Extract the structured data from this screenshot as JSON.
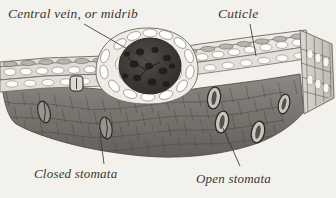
{
  "figure": {
    "kind": "botanical-cross-section-engraving",
    "background_color": "#f3f1ec",
    "ink_color": "#3b3732"
  },
  "labels": {
    "central_vein": "Central vein, or midrib",
    "cuticle": "Cuticle",
    "closed_stomata": "Closed stomata",
    "open_stomata": "Open stomata"
  },
  "structures": {
    "vein_bundle": "central-vein-bundle",
    "upper_epidermis": "upper-epidermis-cell-row",
    "lower_epidermis": "lower-epidermis-cell-row",
    "mesophyll": "mesophyll-cobblestone-tissue",
    "cut_face": "right-cut-face"
  },
  "colors": {
    "mesophyll_dark": "#6f6b66",
    "mesophyll_mid": "#8a8681",
    "epidermis_pale": "#e8e5df",
    "vein_core": "#3a3733",
    "outline": "#55514c"
  },
  "leaders": {
    "central_vein": "leader-line-central-vein",
    "cuticle": "leader-line-cuticle",
    "closed_stomata": "leader-line-closed-stomata",
    "open_stomata": "leader-line-open-stomata"
  }
}
